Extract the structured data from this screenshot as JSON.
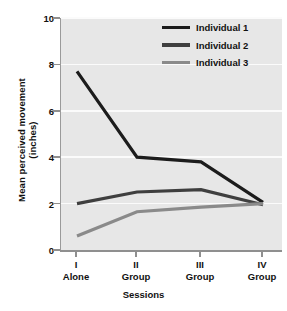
{
  "chart_data": {
    "type": "line",
    "title": "",
    "subtitle": "",
    "xlabel": "Sessions",
    "ylabel": "Mean perceived movement (inches)",
    "ylabel_line1": "Mean perceived movement",
    "ylabel_line2": "(inches)",
    "categories": [
      "I Alone",
      "II Group",
      "III Group",
      "IV Group"
    ],
    "x_tick_labels": [
      {
        "roman": "I",
        "condition": "Alone"
      },
      {
        "roman": "II",
        "condition": "Group"
      },
      {
        "roman": "III",
        "condition": "Group"
      },
      {
        "roman": "IV",
        "condition": "Group"
      }
    ],
    "y_ticks": [
      0,
      2,
      4,
      6,
      8,
      10
    ],
    "y_tick_labels": [
      "0",
      "2",
      "4",
      "6",
      "8",
      "10"
    ],
    "ylim": [
      0,
      10
    ],
    "grid": true,
    "grid_axis": "y",
    "legend_position": "top-right",
    "series": [
      {
        "name": "Individual 1",
        "color": "#1c1c1c",
        "values": [
          7.7,
          4.0,
          3.8,
          2.05
        ]
      },
      {
        "name": "Individual 2",
        "color": "#3f3f3f",
        "values": [
          2.0,
          2.5,
          2.6,
          1.95
        ]
      },
      {
        "name": "Individual 3",
        "color": "#8a8a8a",
        "values": [
          0.6,
          1.65,
          1.85,
          2.0
        ]
      }
    ],
    "colors": {
      "plot_background": "#e7e7e7",
      "figure_background": "#ffffff",
      "gridline": "#fbfbfb",
      "axis": "#8f8f8f",
      "individual_1": "#1c1c1c",
      "individual_2": "#3f3f3f",
      "individual_3": "#8a8a8a"
    }
  }
}
